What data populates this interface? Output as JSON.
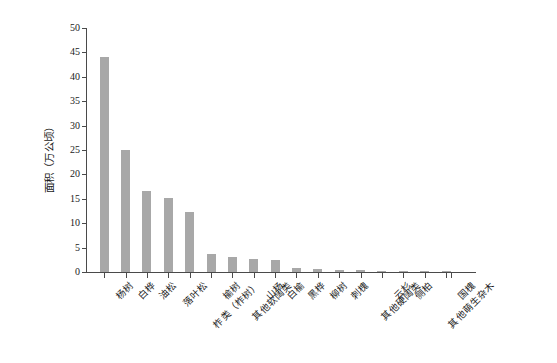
{
  "chart_data": {
    "type": "bar",
    "title": "",
    "xlabel": "",
    "ylabel": "面积（万公顷）",
    "ylim": [
      0,
      50
    ],
    "yticks": [
      0,
      5,
      10,
      15,
      20,
      25,
      30,
      35,
      40,
      45,
      50
    ],
    "grid": false,
    "legend": null,
    "bar_color": "#a8a8a8",
    "axis_color": "#4a4a4a",
    "background": "#ffffff",
    "categories": [
      "杨树",
      "白桦",
      "油松",
      "落叶松",
      "柞类（柞树）",
      "榆树",
      "其他软阔类",
      "山杨",
      "白榆",
      "黑桦",
      "柳树",
      "刺槐",
      "其他硬阔类",
      "云杉",
      "侧柏",
      "其他萌生杂木",
      "国槐"
    ],
    "values": [
      44.0,
      25.0,
      16.6,
      15.2,
      12.4,
      3.6,
      3.0,
      2.7,
      2.4,
      0.9,
      0.7,
      0.5,
      0.4,
      0.25,
      0.15,
      0.1,
      0.05
    ]
  }
}
